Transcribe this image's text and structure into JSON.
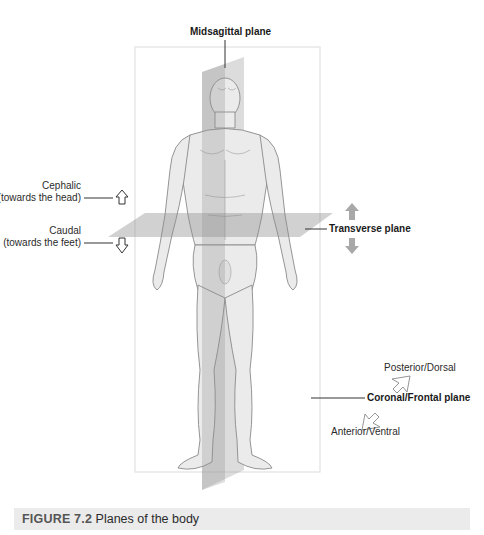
{
  "figure": {
    "title_prefix": "FIGURE 7.2",
    "title": "Planes of the body",
    "caption_band_color": "#ebebeb"
  },
  "labels": {
    "midsagittal": "Midsagittal plane",
    "cephalic": "Cephalic",
    "cephalic_sub": "(towards the head)",
    "caudal": "Caudal",
    "caudal_sub": "(towards the feet)",
    "transverse": "Transverse plane",
    "posterior": "Posterior/Dorsal",
    "coronal": "Coronal/Frontal plane",
    "anterior": "Anterior/Ventral"
  },
  "colors": {
    "plane_fill": "#9a9a9a",
    "frame_stroke": "#e2e2e2",
    "arrow_fill": "#a8a8a8",
    "skin": "#e9e9e9",
    "skin_shadow": "#b8b8b8",
    "leader": "#333333"
  }
}
